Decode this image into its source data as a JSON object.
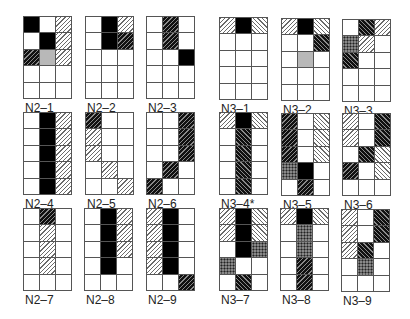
{
  "figure": {
    "legend_codes": {
      "0": "empty",
      "B": "black",
      "G": "gray",
      "L/": "light-hatch-forward",
      "L\\": "light-hatch-back",
      "D/": "dark-hatch-forward",
      "D\\": "dark-hatch-back",
      "P": "dotted"
    },
    "grid_shape": {
      "rows": 5,
      "cols": 3
    },
    "panels": [
      {
        "label": "N2–1",
        "x": 23,
        "y": 16,
        "cells": [
          [
            "B",
            "0",
            "L/"
          ],
          [
            "0",
            "B",
            "L/"
          ],
          [
            "D/",
            "G",
            "L/"
          ],
          [
            "0",
            "0",
            "0"
          ],
          [
            "0",
            "0",
            "0"
          ]
        ]
      },
      {
        "label": "N2–2",
        "x": 85,
        "y": 16,
        "cells": [
          [
            "0",
            "B",
            "L/"
          ],
          [
            "0",
            "B",
            "D/"
          ],
          [
            "0",
            "0",
            "0"
          ],
          [
            "0",
            "0",
            "0"
          ],
          [
            "0",
            "0",
            "0"
          ]
        ]
      },
      {
        "label": "N2–3",
        "x": 146,
        "y": 16,
        "cells": [
          [
            "0",
            "D/",
            "0"
          ],
          [
            "0",
            "D/",
            "0"
          ],
          [
            "0",
            "0",
            "B"
          ],
          [
            "0",
            "0",
            "0"
          ],
          [
            "0",
            "0",
            "0"
          ]
        ]
      },
      {
        "label": "N3–1",
        "x": 219,
        "y": 17,
        "cells": [
          [
            "L/",
            "B",
            "L\\"
          ],
          [
            "0",
            "0",
            "0"
          ],
          [
            "0",
            "0",
            "0"
          ],
          [
            "0",
            "0",
            "0"
          ],
          [
            "0",
            "0",
            "0"
          ]
        ]
      },
      {
        "label": "N3–2",
        "x": 281,
        "y": 18,
        "cells": [
          [
            "L/",
            "B",
            "L\\"
          ],
          [
            "0",
            "0",
            "D\\"
          ],
          [
            "0",
            "G",
            "0"
          ],
          [
            "0",
            "0",
            "0"
          ],
          [
            "0",
            "0",
            "0"
          ]
        ]
      },
      {
        "label": "N3–3",
        "x": 342,
        "y": 19,
        "cells": [
          [
            "0",
            "D\\",
            "L/"
          ],
          [
            "P",
            "L/",
            "0"
          ],
          [
            "D\\",
            "0",
            "0"
          ],
          [
            "0",
            "0",
            "0"
          ],
          [
            "0",
            "0",
            "0"
          ]
        ]
      },
      {
        "label": "N2–4",
        "x": 23,
        "y": 112,
        "cells": [
          [
            "0",
            "B",
            "L/"
          ],
          [
            "0",
            "B",
            "L/"
          ],
          [
            "0",
            "B",
            "L/"
          ],
          [
            "0",
            "B",
            "L/"
          ],
          [
            "0",
            "B",
            "L/"
          ]
        ]
      },
      {
        "label": "N2–5",
        "x": 85,
        "y": 112,
        "cells": [
          [
            "D/",
            "0",
            "0"
          ],
          [
            "L/",
            "0",
            "0"
          ],
          [
            "L/",
            "0",
            "0"
          ],
          [
            "0",
            "L/",
            "0"
          ],
          [
            "0",
            "0",
            "L/"
          ]
        ]
      },
      {
        "label": "N2–6",
        "x": 146,
        "y": 112,
        "cells": [
          [
            "0",
            "0",
            "D/"
          ],
          [
            "0",
            "0",
            "D/"
          ],
          [
            "0",
            "0",
            "D/"
          ],
          [
            "0",
            "D/",
            "0"
          ],
          [
            "D/",
            "0",
            "0"
          ]
        ]
      },
      {
        "label": "N3–4*",
        "x": 219,
        "y": 112,
        "cells": [
          [
            "L/",
            "B",
            "L\\"
          ],
          [
            "0",
            "D\\",
            "0"
          ],
          [
            "0",
            "D\\",
            "0"
          ],
          [
            "0",
            "D\\",
            "0"
          ],
          [
            "0",
            "D\\",
            "0"
          ]
        ]
      },
      {
        "label": "N3–5",
        "x": 281,
        "y": 113,
        "cells": [
          [
            "D/",
            "0",
            "L\\"
          ],
          [
            "D/",
            "0",
            "L\\"
          ],
          [
            "D/",
            "0",
            "L\\"
          ],
          [
            "P",
            "B",
            "0"
          ],
          [
            "0",
            "D/",
            "0"
          ]
        ]
      },
      {
        "label": "N3–6",
        "x": 342,
        "y": 113,
        "cells": [
          [
            "L/",
            "0",
            "D\\"
          ],
          [
            "L/",
            "0",
            "D\\"
          ],
          [
            "0",
            "D\\",
            "L\\"
          ],
          [
            "D/",
            "0",
            "L\\"
          ],
          [
            "0",
            "0",
            "0"
          ]
        ]
      },
      {
        "label": "N2–7",
        "x": 23,
        "y": 208,
        "cells": [
          [
            "0",
            "D/",
            "0"
          ],
          [
            "0",
            "L/",
            "0"
          ],
          [
            "0",
            "L/",
            "0"
          ],
          [
            "0",
            "L/",
            "0"
          ],
          [
            "0",
            "0",
            "0"
          ]
        ]
      },
      {
        "label": "N2–8",
        "x": 84,
        "y": 208,
        "cells": [
          [
            "0",
            "B",
            "L/"
          ],
          [
            "0",
            "B",
            "L/"
          ],
          [
            "0",
            "B",
            "L/"
          ],
          [
            "0",
            "B",
            "0"
          ],
          [
            "0",
            "0",
            "0"
          ]
        ]
      },
      {
        "label": "N2–9",
        "x": 146,
        "y": 208,
        "cells": [
          [
            "L/",
            "B",
            "0"
          ],
          [
            "L/",
            "B",
            "0"
          ],
          [
            "L/",
            "B",
            "0"
          ],
          [
            "L/",
            "B",
            "0"
          ],
          [
            "0",
            "0",
            "D/"
          ]
        ]
      },
      {
        "label": "N3–7",
        "x": 219,
        "y": 208,
        "cells": [
          [
            "L/",
            "B",
            "L\\"
          ],
          [
            "L/",
            "B",
            "L\\"
          ],
          [
            "0",
            "B",
            "P"
          ],
          [
            "P",
            "0",
            "0"
          ],
          [
            "0",
            "D\\",
            "0"
          ]
        ]
      },
      {
        "label": "N3–8",
        "x": 280,
        "y": 208,
        "cells": [
          [
            "L/",
            "B",
            "L\\"
          ],
          [
            "0",
            "P",
            "0"
          ],
          [
            "0",
            "P",
            "0"
          ],
          [
            "0",
            "D/",
            "0"
          ],
          [
            "0",
            "D/",
            "0"
          ]
        ]
      },
      {
        "label": "N3–9",
        "x": 341,
        "y": 209,
        "cells": [
          [
            "L/",
            "0",
            "D\\"
          ],
          [
            "L/",
            "0",
            "D\\"
          ],
          [
            "L/",
            "D\\",
            "0"
          ],
          [
            "0",
            "P",
            "0"
          ],
          [
            "0",
            "0",
            "0"
          ]
        ]
      }
    ]
  }
}
